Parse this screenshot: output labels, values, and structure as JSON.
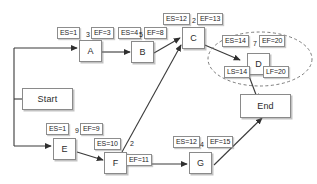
{
  "diagram": {
    "type": "project-network-diagram",
    "nodes": [
      {
        "id": "start",
        "label": "Start"
      },
      {
        "id": "a",
        "label": "A"
      },
      {
        "id": "b",
        "label": "B"
      },
      {
        "id": "c",
        "label": "C"
      },
      {
        "id": "d",
        "label": "D"
      },
      {
        "id": "e",
        "label": "E"
      },
      {
        "id": "f",
        "label": "F"
      },
      {
        "id": "g",
        "label": "G"
      },
      {
        "id": "end",
        "label": "End"
      }
    ],
    "labels": {
      "a_es": "ES=1",
      "a_dur": "3",
      "a_ef": "EF=3",
      "b_es": "ES=4",
      "b_dur": "5",
      "b_ef": "EF=8",
      "c_es": "ES=12",
      "c_dur": "2",
      "c_ef": "EF=13",
      "d_es": "ES=14",
      "d_dur": "7",
      "d_ef": "EF=20",
      "d_ls": "LS=14",
      "d_lf": "LF=20",
      "e_es": "ES=1",
      "e_dur": "9",
      "e_ef": "EF=9",
      "f_es": "ES=10",
      "f_dur": "2",
      "f_ef": "EF=11",
      "g_es": "ES=12",
      "g_dur": "4",
      "g_ef": "EF=15"
    },
    "edges": [
      {
        "from": "start",
        "to": "a"
      },
      {
        "from": "a",
        "to": "b"
      },
      {
        "from": "b",
        "to": "c"
      },
      {
        "from": "c",
        "to": "d"
      },
      {
        "from": "d",
        "to": "end"
      },
      {
        "from": "start",
        "to": "e"
      },
      {
        "from": "e",
        "to": "f"
      },
      {
        "from": "f",
        "to": "c"
      },
      {
        "from": "f",
        "to": "g"
      },
      {
        "from": "g",
        "to": "end"
      }
    ],
    "highlight": {
      "name": "dashed-ellipse-around-d",
      "target": "d"
    },
    "colors": {
      "background": "#ffffff",
      "box_border": "#8a8a8a",
      "line": "#3a3a3a",
      "text": "#1e1e1e"
    }
  }
}
